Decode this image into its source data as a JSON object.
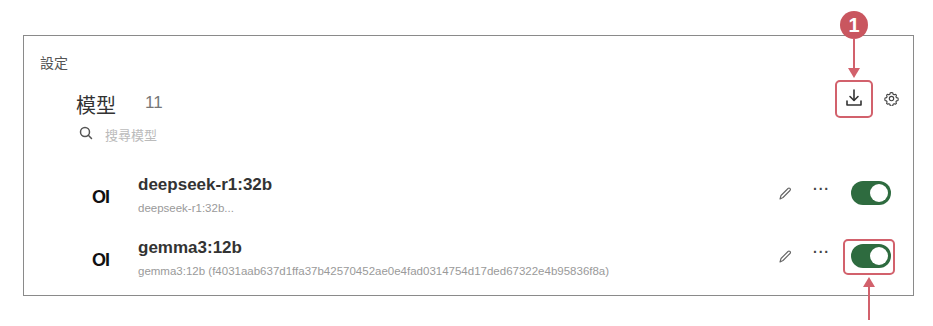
{
  "breadcrumb": "設定",
  "header": {
    "title": "模型",
    "count": "11"
  },
  "search": {
    "placeholder": "搜尋模型",
    "value": ""
  },
  "toolbar": {
    "download_icon": "download-icon",
    "settings_icon": "gear-icon"
  },
  "models": [
    {
      "logo": "OI",
      "name": "deepseek-r1:32b",
      "description": "deepseek-r1:32b...",
      "enabled": true,
      "more_label": "···"
    },
    {
      "logo": "OI",
      "name": "gemma3:12b",
      "description": "gemma3:12b (f4031aab637d1ffa37b42570452ae0e4fad0314754d17ded67322e4b95836f8a)",
      "enabled": true,
      "more_label": "···"
    }
  ],
  "annotations": {
    "step_badge": "1",
    "accent_color": "#d2616c",
    "toggle_color": "#2e6b3f"
  }
}
